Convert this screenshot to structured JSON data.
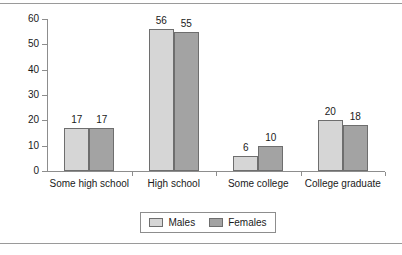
{
  "chart_data": {
    "type": "bar",
    "title": "",
    "subtitle": "",
    "xlabel": "",
    "ylabel": "",
    "categories": [
      "Some high school",
      "High school",
      "Some college",
      "College graduate"
    ],
    "series": [
      {
        "name": "Males",
        "values": [
          17,
          56,
          6,
          20
        ],
        "color": "#d6d6d6"
      },
      {
        "name": "Females",
        "values": [
          17,
          55,
          10,
          18
        ],
        "color": "#a3a3a3"
      }
    ],
    "ylim": [
      0,
      60
    ],
    "y_ticks": [
      0,
      10,
      20,
      30,
      40,
      50,
      60
    ],
    "y_tick_labels": [
      "0",
      "10",
      "20",
      "30",
      "40",
      "50",
      "60"
    ],
    "grid": false,
    "legend_position": "bottom",
    "data_labels": true,
    "bar_edge_color": "#6e6e6e",
    "axis_color": "#8d8d8d"
  },
  "legend": {
    "items": [
      {
        "label": "Males"
      },
      {
        "label": "Females"
      }
    ]
  }
}
